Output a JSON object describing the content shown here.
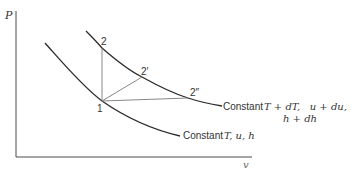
{
  "axes": {
    "y_label": "P",
    "x_label": "v"
  },
  "points": {
    "p1": "1",
    "p2": "2",
    "p2prime": "2′",
    "p2dprime": "2″"
  },
  "curves": {
    "upper": {
      "label_line1_prefix": "Constant",
      "label_line1_math": "T + dT,   u + du,",
      "label_line2_math": "h + dh"
    },
    "lower": {
      "label_prefix": "Constant",
      "label_math": "T, u, h"
    }
  },
  "colors": {
    "curve": "#2a2a2a",
    "construction": "#7a7a7a",
    "axis": "#4a4a4a",
    "text": "#333333"
  }
}
